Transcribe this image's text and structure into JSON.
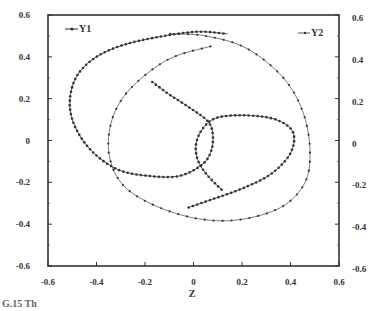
{
  "chart_data": {
    "type": "line",
    "title": "",
    "xlabel": "Z",
    "ylabel_left": "",
    "ylabel_right": "",
    "xlim": [
      -0.6,
      0.6
    ],
    "ylim": [
      -0.6,
      0.6
    ],
    "x_ticks": [
      -0.6,
      -0.4,
      -0.2,
      0,
      0.2,
      0.4,
      0.6
    ],
    "x_tick_labels": [
      "-0.6",
      "-0.4",
      "-0.2",
      "0",
      "0.2",
      "0.4",
      "0.6"
    ],
    "y_ticks": [
      -0.6,
      -0.4,
      -0.2,
      0,
      0.2,
      0.4,
      0.6
    ],
    "y_tick_labels": [
      "-0.6",
      "-0.4",
      "-0.2",
      "0",
      "0.2",
      "0.4",
      "0.6"
    ],
    "grid": false,
    "legend": [
      {
        "name": "Y1",
        "position": "top-left"
      },
      {
        "name": "Y2",
        "position": "top-right"
      }
    ],
    "series": [
      {
        "name": "Y1",
        "marker_density": "dense",
        "points": [
          [
            -0.17,
            0.28
          ],
          [
            -0.1,
            0.22
          ],
          [
            -0.02,
            0.16
          ],
          [
            0.06,
            0.09
          ],
          [
            0.08,
            0.02
          ],
          [
            0.07,
            -0.06
          ],
          [
            0.03,
            -0.12
          ],
          [
            -0.06,
            -0.17
          ],
          [
            -0.18,
            -0.17
          ],
          [
            -0.31,
            -0.14
          ],
          [
            -0.42,
            -0.05
          ],
          [
            -0.49,
            0.07
          ],
          [
            -0.51,
            0.19
          ],
          [
            -0.48,
            0.31
          ],
          [
            -0.4,
            0.4
          ],
          [
            -0.28,
            0.46
          ],
          [
            -0.12,
            0.5
          ],
          [
            0.02,
            0.52
          ],
          [
            0.14,
            0.51
          ]
        ]
      },
      {
        "name": "Y2",
        "marker_density": "sparse",
        "points": [
          [
            0.07,
            0.45
          ],
          [
            -0.1,
            0.39
          ],
          [
            -0.25,
            0.26
          ],
          [
            -0.33,
            0.12
          ],
          [
            -0.35,
            -0.05
          ],
          [
            -0.3,
            -0.2
          ],
          [
            -0.18,
            -0.3
          ],
          [
            0.0,
            -0.37
          ],
          [
            0.18,
            -0.38
          ],
          [
            0.36,
            -0.32
          ],
          [
            0.46,
            -0.2
          ],
          [
            0.48,
            -0.04
          ],
          [
            0.45,
            0.14
          ],
          [
            0.37,
            0.3
          ],
          [
            0.22,
            0.44
          ],
          [
            0.05,
            0.5
          ],
          [
            -0.1,
            0.51
          ]
        ]
      },
      {
        "name": "Y1-inner",
        "marker_density": "dense",
        "points": [
          [
            -0.02,
            -0.32
          ],
          [
            0.08,
            -0.28
          ],
          [
            0.2,
            -0.23
          ],
          [
            0.32,
            -0.16
          ],
          [
            0.4,
            -0.06
          ],
          [
            0.41,
            0.04
          ],
          [
            0.34,
            0.1
          ],
          [
            0.22,
            0.12
          ],
          [
            0.1,
            0.11
          ],
          [
            0.04,
            0.06
          ],
          [
            0.01,
            -0.02
          ],
          [
            0.02,
            -0.1
          ],
          [
            0.06,
            -0.17
          ],
          [
            0.12,
            -0.24
          ]
        ]
      }
    ]
  },
  "caption": "G.15   Th"
}
